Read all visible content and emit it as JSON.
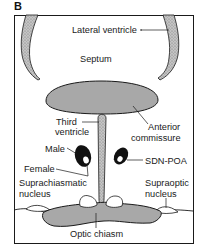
{
  "figure": {
    "panel_letter": "B",
    "colors": {
      "frame": "#1a1a1a",
      "structure_fill": "#a8a8a8",
      "ventricle_fill": "#b0b0b0",
      "nucleus_fill": "#111111",
      "background": "#ffffff"
    }
  },
  "labels": {
    "lateral_ventricle": "Lateral ventricle",
    "septum": "Septum",
    "third_ventricle_line1": "Third",
    "third_ventricle_line2": "ventricle",
    "anterior_commissure_line1": "Anterior",
    "anterior_commissure_line2": "commissure",
    "male": "Male",
    "female": "Female",
    "sdn_poa": "SDN-POA",
    "suprachiasmatic_line1": "Suprachiasmatic",
    "suprachiasmatic_line2": "nucleus",
    "supraoptic_line1": "Supraoptic",
    "supraoptic_line2": "nucleus",
    "optic_chiasm": "Optic chiasm"
  }
}
